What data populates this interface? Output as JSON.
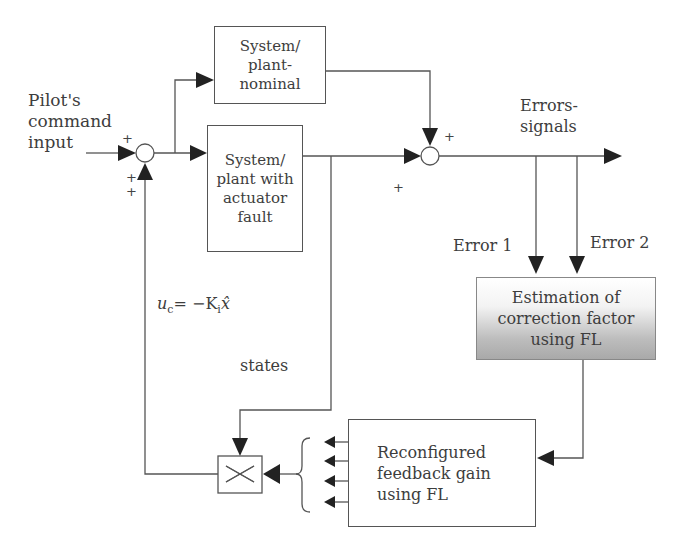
{
  "diagram": {
    "type": "block-diagram",
    "input_label": "Pilot's\ncommand\ninput",
    "blocks": {
      "nominal": "System/\nplant-\nnominal",
      "faulty": "System/\nplant with\nactuator\nfault",
      "estimation": "Estimation of\ncorrection factor\nusing FL",
      "reconfigured": "Reconfigured\nfeedback gain\nusing FL"
    },
    "labels": {
      "errors_signals": "Errors-\nsignals",
      "error1": "Error 1",
      "error2": "Error 2",
      "states": "states",
      "control_law_u": "u",
      "control_law_u_sub": "c",
      "control_law_eq": "= −K",
      "control_law_K_sub": "i",
      "control_law_xhat": "x̂"
    },
    "signs": {
      "sum1_input": "+",
      "sum1_feedback_a": "+",
      "sum1_feedback_b": "+",
      "sum2_top": "+",
      "sum2_left": "+"
    },
    "colors": {
      "line": "#555555",
      "arrow": "#222222",
      "gradient_top": "#ffffff",
      "gradient_bottom": "#a9a9a9"
    }
  }
}
